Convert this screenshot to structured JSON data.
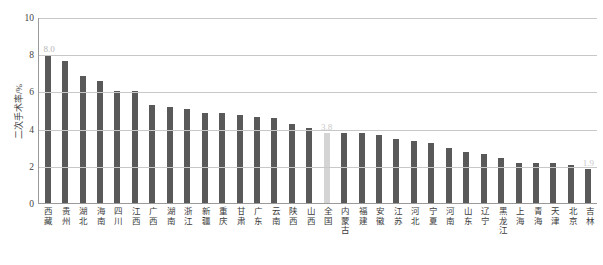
{
  "chart_data": {
    "type": "bar",
    "title": "",
    "xlabel": "",
    "ylabel": "二次手术率/%",
    "ylim": [
      0,
      10
    ],
    "yticks": [
      "0",
      "2",
      "4",
      "6",
      "8",
      "10"
    ],
    "gridlines": true,
    "legend": "none",
    "categories": [
      "西藏",
      "贵州",
      "湖北",
      "海南",
      "四川",
      "江西",
      "广西",
      "湖南",
      "浙江",
      "新疆",
      "重庆",
      "甘肃",
      "广东",
      "云南",
      "陕西",
      "山西",
      "全国",
      "内蒙古",
      "福建",
      "安徽",
      "江苏",
      "河北",
      "宁夏",
      "河南",
      "山东",
      "辽宁",
      "黑龙江",
      "上海",
      "青海",
      "天津",
      "北京",
      "吉林"
    ],
    "values": [
      8.0,
      7.7,
      6.9,
      6.6,
      6.1,
      6.1,
      5.3,
      5.2,
      5.1,
      4.9,
      4.9,
      4.8,
      4.7,
      4.6,
      4.3,
      4.1,
      3.8,
      3.8,
      3.8,
      3.7,
      3.5,
      3.4,
      3.3,
      3.0,
      2.8,
      2.7,
      2.5,
      2.2,
      2.2,
      2.2,
      2.1,
      1.9
    ],
    "highlight_index": 16,
    "highlight_color": "#d4d4d4",
    "bar_color": "#595959",
    "data_labels": {
      "0": "8.0",
      "16": "3.8",
      "31": "1.9"
    }
  }
}
